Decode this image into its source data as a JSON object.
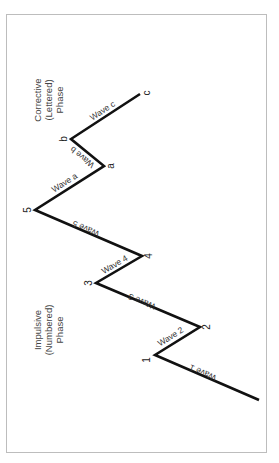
{
  "diagram": {
    "type": "elliott-wave",
    "orientation": "rotated-90-ccw",
    "phases": {
      "impulsive": {
        "line1": "Impulsive",
        "line2": "(Numbered)",
        "line3": "Phase"
      },
      "corrective": {
        "line1": "Corrective",
        "line2": "(Lettered)",
        "line3": "Phase"
      }
    },
    "points": {
      "p1": "1",
      "p2": "2",
      "p3": "3",
      "p4": "4",
      "p5": "5",
      "pa": "a",
      "pb": "b",
      "pc": "c"
    },
    "waves": {
      "w1": "Wave 1",
      "w2": "Wave 2",
      "w3": "Wave 3",
      "w4": "Wave 4",
      "w5": "Wave 5",
      "wa": "Wave a",
      "wb": "Wave b",
      "wc": "Wave c"
    },
    "colors": {
      "line": "#111111",
      "frame": "#bdbdbd",
      "text": "#333333"
    }
  }
}
